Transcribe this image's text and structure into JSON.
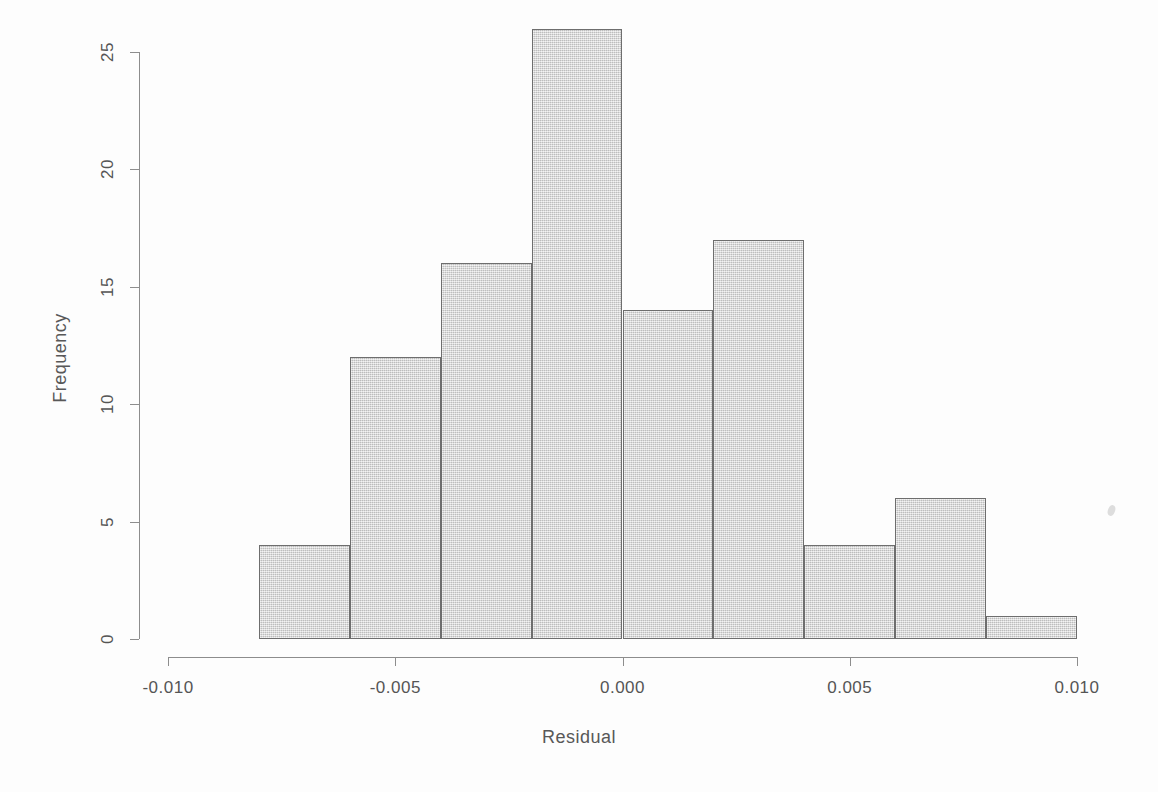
{
  "figure": {
    "background_color": "#fdfdfd",
    "bar_fill_color": "#d2d2d2",
    "bar_border_color": "#6e6e6e",
    "axis_color": "#8d8d8d",
    "text_color": "#555555"
  },
  "chart_data": {
    "type": "bar",
    "subtype": "histogram",
    "title": "",
    "xlabel": "Residual",
    "ylabel": "Frequency",
    "xlim": [
      -0.0105,
      0.0105
    ],
    "ylim": [
      0,
      26
    ],
    "grid": false,
    "legend": null,
    "bin_width": 0.002,
    "bin_edges": [
      -0.008,
      -0.006,
      -0.004,
      -0.002,
      0.0,
      0.002,
      0.004,
      0.006,
      0.008,
      0.01
    ],
    "categories": [
      "-0.008 to -0.006",
      "-0.006 to -0.004",
      "-0.004 to -0.002",
      "-0.002 to 0.000",
      "0.000 to 0.002",
      "0.002 to 0.004",
      "0.004 to 0.006",
      "0.006 to 0.008",
      "0.008 to 0.010"
    ],
    "values": [
      4,
      12,
      16,
      26,
      14,
      17,
      4,
      6,
      1
    ],
    "total_count": 100,
    "x_ticks": [
      -0.01,
      -0.005,
      0.0,
      0.005,
      0.01
    ],
    "x_tick_labels": [
      "-0.010",
      "-0.005",
      "0.000",
      "0.005",
      "0.010"
    ],
    "y_ticks": [
      0,
      5,
      10,
      15,
      20,
      25
    ],
    "y_tick_labels": [
      "0",
      "5",
      "10",
      "15",
      "20",
      "25"
    ]
  },
  "axes": {
    "x_title": "Residual",
    "y_title": "Frequency"
  }
}
